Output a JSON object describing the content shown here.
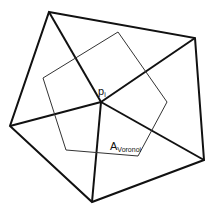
{
  "diagram": {
    "type": "voronoi-cell-on-triangle-fan",
    "colors": {
      "background": "#ffffff",
      "edges": "#111111",
      "voronoi": "#333333"
    },
    "center_point": {
      "label": "p",
      "subscript": "i",
      "x": 101,
      "y": 102
    },
    "outer_vertices": [
      {
        "x": 49,
        "y": 12
      },
      {
        "x": 195,
        "y": 38
      },
      {
        "x": 204,
        "y": 160
      },
      {
        "x": 92,
        "y": 202
      },
      {
        "x": 10,
        "y": 126
      }
    ],
    "voronoi_polygon": [
      {
        "x": 43,
        "y": 78
      },
      {
        "x": 118,
        "y": 32
      },
      {
        "x": 167,
        "y": 102
      },
      {
        "x": 138,
        "y": 156
      },
      {
        "x": 66,
        "y": 150
      }
    ],
    "area_label": {
      "main": "A",
      "subscript": "Voronoi"
    }
  }
}
